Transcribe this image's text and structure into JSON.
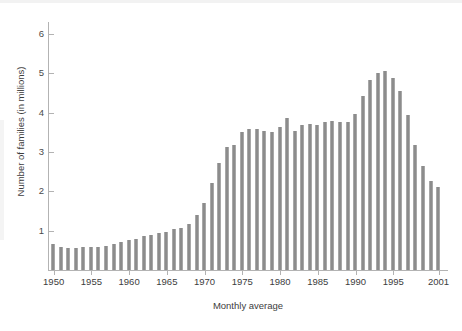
{
  "chart_data": {
    "type": "bar",
    "title": "",
    "subtitle": "",
    "xlabel": "Monthly average",
    "ylabel": "Number of families (in millions)",
    "ylim": [
      0,
      6.3
    ],
    "ytick_labels": [
      "1",
      "2",
      "3",
      "4",
      "5",
      "6"
    ],
    "ytick_values": [
      1,
      2,
      3,
      4,
      5,
      6
    ],
    "xtick_labels": [
      "1950",
      "1955",
      "1960",
      "1965",
      "1970",
      "1975",
      "1980",
      "1985",
      "1990",
      "1995",
      "2001"
    ],
    "xtick_values": [
      1950,
      1955,
      1960,
      1965,
      1970,
      1975,
      1980,
      1985,
      1990,
      1995,
      2001
    ],
    "grid": false,
    "legend": false,
    "legend_position": "none",
    "bar_color": "#8c8c8c",
    "axis_color": "#b3b3b3",
    "categories": [
      "1950",
      "1951",
      "1952",
      "1953",
      "1954",
      "1955",
      "1956",
      "1957",
      "1958",
      "1959",
      "1960",
      "1961",
      "1962",
      "1963",
      "1964",
      "1965",
      "1966",
      "1967",
      "1968",
      "1969",
      "1970",
      "1971",
      "1972",
      "1973",
      "1974",
      "1975",
      "1976",
      "1977",
      "1978",
      "1979",
      "1980",
      "1981",
      "1982",
      "1983",
      "1984",
      "1985",
      "1986",
      "1987",
      "1988",
      "1989",
      "1990",
      "1991",
      "1992",
      "1993",
      "1994",
      "1995",
      "1996",
      "1997",
      "1998",
      "1999",
      "2000",
      "2001"
    ],
    "values": [
      0.65,
      0.58,
      0.56,
      0.55,
      0.58,
      0.59,
      0.58,
      0.6,
      0.67,
      0.72,
      0.75,
      0.8,
      0.86,
      0.89,
      0.94,
      0.96,
      1.04,
      1.08,
      1.18,
      1.41,
      1.7,
      2.22,
      2.72,
      3.12,
      3.17,
      3.5,
      3.57,
      3.58,
      3.53,
      3.5,
      3.64,
      3.87,
      3.54,
      3.69,
      3.72,
      3.69,
      3.75,
      3.78,
      3.75,
      3.77,
      3.97,
      4.42,
      4.83,
      5.01,
      5.05,
      4.88,
      4.55,
      3.95,
      3.18,
      2.65,
      2.26,
      2.12
    ]
  }
}
